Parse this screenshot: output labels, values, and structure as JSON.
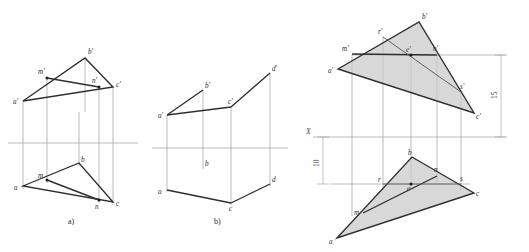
{
  "figure": {
    "title_caption_a": "a)",
    "title_caption_b": "b)",
    "type": "descriptive-geometry-orthographic-projection",
    "background_color": "#ffffff",
    "line_color_thick": "#2e2e2e",
    "line_color_thin": "#8d8d8d",
    "shade_color": "#c9c9c9"
  },
  "diagram_a": {
    "caption": "a)",
    "labels": {
      "a_prime": "a'",
      "b_prime": "b'",
      "c_prime": "c'",
      "m_prime": "m'",
      "n_prime": "n'",
      "a": "a",
      "b": "b",
      "c": "c",
      "m": "m",
      "n": "n"
    },
    "points_upper": {
      "a_prime": [
        23,
        101
      ],
      "b_prime": [
        85,
        58
      ],
      "c_prime": [
        113,
        87
      ],
      "m_prime": [
        47,
        78
      ],
      "n_prime": [
        99,
        87
      ]
    },
    "points_lower": {
      "a": [
        23,
        186
      ],
      "b": [
        79,
        163
      ],
      "c": [
        113,
        202
      ],
      "m": [
        47,
        180
      ],
      "n": [
        99,
        200
      ]
    },
    "axis_y": 143
  },
  "diagram_b": {
    "caption": "b)",
    "labels": {
      "a_prime": "a'",
      "b_prime": "b'",
      "c_prime": "c'",
      "d_prime": "d'",
      "a": "a",
      "b": "b",
      "c": "c",
      "d": "d"
    },
    "points_upper": {
      "a_prime": [
        167,
        115
      ],
      "b_prime": [
        203,
        90
      ],
      "c_prime": [
        231,
        107
      ],
      "d_prime": [
        270,
        73
      ]
    },
    "points_lower": {
      "a": [
        167,
        190
      ],
      "b": [
        203,
        167
      ],
      "c": [
        231,
        203
      ],
      "d": [
        270,
        184
      ]
    },
    "axis_y": 148
  },
  "diagram_c": {
    "axis_label": "X",
    "dimensions": {
      "upper_value": "15",
      "lower_value": "10"
    },
    "labels_upper": {
      "a_prime": "a'",
      "b_prime": "b'",
      "c_prime": "c'",
      "m_prime": "m'",
      "n_prime": "n'",
      "r_prime": "r'",
      "s_prime": "s'",
      "e_prime": "e'"
    },
    "labels_lower": {
      "a": "a",
      "b": "b",
      "c": "c",
      "m": "m",
      "n": "n",
      "r": "r",
      "s": "s",
      "e": "e"
    },
    "points_upper": {
      "a_prime": [
        338,
        69
      ],
      "b_prime": [
        419,
        22
      ],
      "c_prime": [
        474,
        113
      ],
      "m_prime": [
        352,
        54
      ],
      "n_prime": [
        437,
        55
      ],
      "r_prime": [
        383,
        37
      ],
      "s_prime": [
        461,
        92
      ],
      "e_prime": [
        411,
        55
      ]
    },
    "points_lower": {
      "a": [
        337,
        238
      ],
      "b": [
        412,
        157
      ],
      "c": [
        474,
        193
      ],
      "m": [
        363,
        213
      ],
      "n": [
        437,
        176
      ],
      "r": [
        383,
        184
      ],
      "s": [
        461,
        184
      ],
      "e": [
        411,
        184
      ]
    },
    "axis_y": 137
  }
}
